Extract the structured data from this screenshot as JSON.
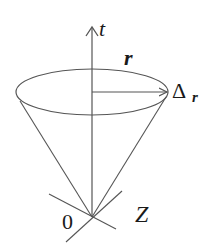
{
  "diagram": {
    "labels": {
      "t_axis": "t",
      "radius": "r",
      "delta": "Δ",
      "delta_subscript": "r",
      "origin": "0",
      "z_label": "Z"
    },
    "colors": {
      "stroke": "#555555",
      "text": "#1a1a1a",
      "background": "#ffffff"
    },
    "geometry": {
      "apex": [
        92,
        217
      ],
      "ellipse_center": [
        92,
        92
      ],
      "ellipse_rx": 76,
      "ellipse_ry": 23
    }
  }
}
